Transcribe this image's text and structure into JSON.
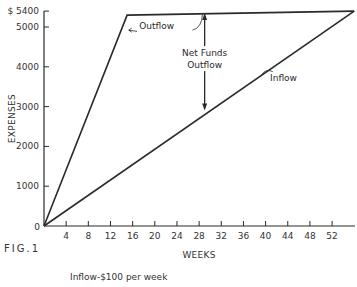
{
  "figure_label": "FIG.1",
  "caption": "Inflow-$100 per week",
  "chart_data": {
    "type": "line",
    "title": "",
    "xlabel": "WEEKS",
    "ylabel": "EXPENSES",
    "xlim": [
      0,
      56
    ],
    "ylim": [
      0,
      5400
    ],
    "x_ticks": [
      4,
      8,
      12,
      16,
      20,
      24,
      28,
      32,
      36,
      40,
      44,
      48,
      52
    ],
    "y_ticks": [
      0,
      1000,
      2000,
      3000,
      4000,
      5000,
      5400
    ],
    "y_tick_labels": [
      "0",
      "1000",
      "2000",
      "3000",
      "4000",
      "5000",
      "$ 5400"
    ],
    "grid": false,
    "legend": "none (inline labels)",
    "series": [
      {
        "name": "Outflow",
        "points": [
          [
            0,
            0
          ],
          [
            15,
            5300
          ],
          [
            56,
            5400
          ]
        ]
      },
      {
        "name": "Inflow",
        "points": [
          [
            0,
            0
          ],
          [
            56,
            5400
          ]
        ]
      }
    ],
    "annotations": [
      {
        "text": "Outflow",
        "target": "Outflow line near week 15"
      },
      {
        "text": "Inflow",
        "target": "Inflow line near week 40"
      },
      {
        "text": "Net Funds Outflow",
        "type": "double-arrow",
        "x": 29,
        "from": 2900,
        "to": 5350
      }
    ]
  }
}
